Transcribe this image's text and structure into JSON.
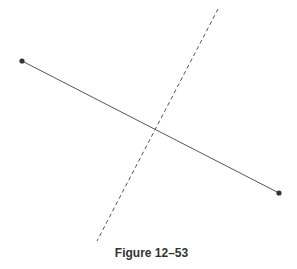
{
  "figure": {
    "caption": "Figure 12–53",
    "segment": {
      "x1": 22,
      "y1": 61,
      "x2": 279,
      "y2": 193,
      "color": "#555555"
    },
    "endpoints": [
      {
        "x": 22,
        "y": 61
      },
      {
        "x": 279,
        "y": 193
      }
    ],
    "bisector": {
      "x1": 218,
      "y1": 9,
      "x2": 97,
      "y2": 241,
      "color": "#555555",
      "style": "dashed"
    }
  }
}
